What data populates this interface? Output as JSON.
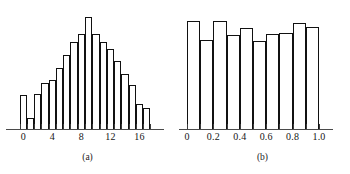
{
  "figure": {
    "panels": [
      {
        "id": "a",
        "caption": "(a)",
        "chart_ref": 0
      },
      {
        "id": "b",
        "caption": "(b)",
        "chart_ref": 1
      }
    ]
  },
  "chart_data": [
    {
      "type": "bar",
      "title": "",
      "subtitle": "",
      "xlabel": "",
      "ylabel": "",
      "grid": false,
      "legend": null,
      "panel_label": "(a)",
      "xlim": [
        -1,
        18
      ],
      "ylim": [
        0,
        100
      ],
      "tick_labels": [
        "0",
        "4",
        "8",
        "12",
        "16"
      ],
      "tick_values": [
        0,
        4,
        8,
        12,
        16
      ],
      "categories": [
        -1,
        0,
        1,
        2,
        3,
        4,
        5,
        6,
        7,
        8,
        9,
        10,
        11,
        12,
        13,
        14,
        15,
        16,
        17
      ],
      "values": [
        0,
        29,
        9,
        30,
        39,
        42,
        52,
        63,
        74,
        81,
        96,
        81,
        74,
        68,
        58,
        47,
        38,
        21,
        18
      ]
    },
    {
      "type": "bar",
      "title": "",
      "subtitle": "",
      "xlabel": "",
      "ylabel": "",
      "grid": false,
      "legend": null,
      "panel_label": "(b)",
      "xlim": [
        0,
        1.0
      ],
      "ylim": [
        0,
        100
      ],
      "tick_labels": [
        "0",
        "0.2",
        "0.4",
        "0.6",
        "0.8",
        "1.0"
      ],
      "tick_values": [
        0,
        0.2,
        0.4,
        0.6,
        0.8,
        1.0
      ],
      "categories": [
        0.05,
        0.15,
        0.25,
        0.35,
        0.45,
        0.55,
        0.65,
        0.75,
        0.85,
        0.95
      ],
      "values": [
        92,
        76,
        92,
        80,
        86,
        75,
        81,
        82,
        91,
        87
      ]
    }
  ],
  "colors": {
    "bar_stroke": "#111111",
    "bar_fill": "#ffffff",
    "axis": "#4a4a4a",
    "text": "#161616",
    "background": "#ffffff"
  }
}
